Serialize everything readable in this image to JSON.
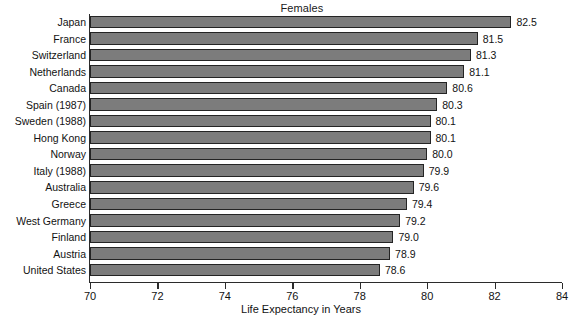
{
  "chart_data": {
    "type": "bar",
    "orientation": "horizontal",
    "title": "Females",
    "subtitle": "",
    "xlabel": "Life Expectancy in Years",
    "ylabel": "",
    "xlim": [
      70,
      84
    ],
    "xticks": [
      70,
      72,
      74,
      76,
      78,
      80,
      82,
      84
    ],
    "xtick_labels": [
      "70",
      "72",
      "74",
      "76",
      "78",
      "80",
      "82",
      "84"
    ],
    "grid": false,
    "legend": null,
    "bar_color": "#7c7c7c",
    "bar_edge_color": "#242424",
    "categories": [
      "Japan",
      "France",
      "Switzerland",
      "Netherlands",
      "Canada",
      "Spain (1987)",
      "Sweden (1988)",
      "Hong Kong",
      "Norway",
      "Italy (1988)",
      "Australia",
      "Greece",
      "West Germany",
      "Finland",
      "Austria",
      "United States"
    ],
    "values": [
      82.5,
      81.5,
      81.3,
      81.1,
      80.6,
      80.3,
      80.1,
      80.1,
      80.0,
      79.9,
      79.6,
      79.4,
      79.2,
      79.0,
      78.9,
      78.6
    ],
    "value_labels": [
      "82.5",
      "81.5",
      "81.3",
      "81.1",
      "80.6",
      "80.3",
      "80.1",
      "80.1",
      "80.0",
      "79.9",
      "79.6",
      "79.4",
      "79.2",
      "79.0",
      "78.9",
      "78.6"
    ]
  }
}
